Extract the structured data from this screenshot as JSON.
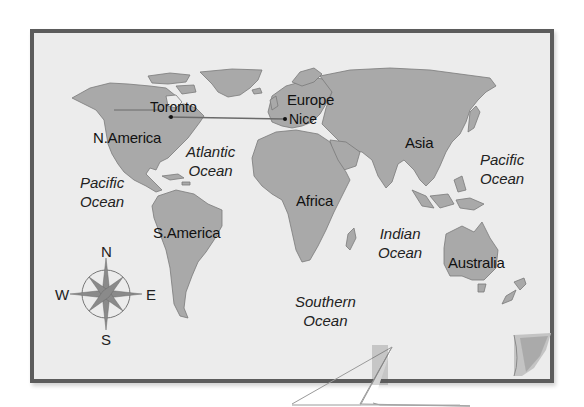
{
  "map": {
    "type": "world-map",
    "style": "grayscale political outline",
    "colors": {
      "background": "#ffffff",
      "frame_border": "#5c5c5c",
      "paper": "#ececec",
      "land": "#a9a9a9",
      "borders": "#777777",
      "route_line": "#6a6a6a"
    },
    "continents": [
      {
        "id": "north-america",
        "label": "N.America"
      },
      {
        "id": "south-america",
        "label": "S.America"
      },
      {
        "id": "europe",
        "label": "Europe"
      },
      {
        "id": "africa",
        "label": "Africa"
      },
      {
        "id": "asia",
        "label": "Asia"
      },
      {
        "id": "australia",
        "label": "Australia"
      }
    ],
    "oceans": [
      {
        "id": "atlantic",
        "line1": "Atlantic",
        "line2": "Ocean"
      },
      {
        "id": "pacific-west",
        "line1": "Pacific",
        "line2": "Ocean"
      },
      {
        "id": "pacific-east",
        "line1": "Pacific",
        "line2": "Ocean"
      },
      {
        "id": "indian",
        "line1": "Indian",
        "line2": "Ocean"
      },
      {
        "id": "southern",
        "line1": "Southern",
        "line2": "Ocean"
      }
    ],
    "cities": [
      {
        "id": "toronto",
        "label": "Toronto"
      },
      {
        "id": "nice",
        "label": "Nice"
      }
    ],
    "route": {
      "from": "Toronto",
      "to": "Nice"
    },
    "compass": {
      "n": "N",
      "s": "S",
      "e": "E",
      "w": "W"
    }
  }
}
